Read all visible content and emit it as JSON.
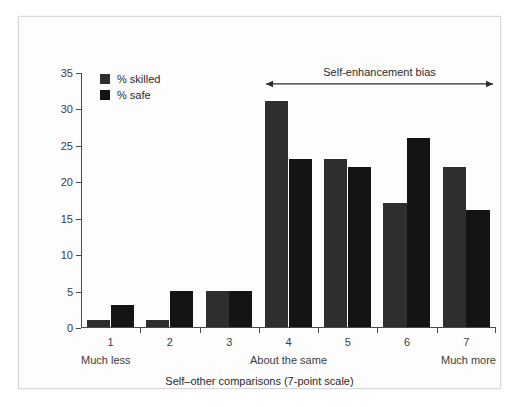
{
  "chart_data": {
    "type": "bar",
    "title": "",
    "subtitle": "",
    "xlabel": "Self–other comparisons (7-point scale)",
    "ylabel": "",
    "categories": [
      "1",
      "2",
      "3",
      "4",
      "5",
      "6",
      "7"
    ],
    "ylim": [
      0,
      35
    ],
    "yticks": [
      0,
      5,
      10,
      15,
      20,
      25,
      30,
      35
    ],
    "ytick_labels": [
      "0",
      "5",
      "10",
      "15",
      "20",
      "25",
      "30",
      "35"
    ],
    "grid": false,
    "legend_position": "upper-left",
    "series": [
      {
        "name": "% skilled",
        "color": "#2e2e2e",
        "values": [
          1,
          1,
          5,
          31,
          23,
          17,
          22
        ]
      },
      {
        "name": "% safe",
        "color": "#141414",
        "values": [
          3,
          5,
          5,
          23,
          22,
          26,
          16
        ]
      }
    ],
    "annotations": [
      {
        "text": "Self-enhancement bias",
        "type": "double-arrow",
        "from_category": "4",
        "to_category": "7",
        "y": 33.5
      }
    ],
    "axis_end_labels": {
      "left": "Much less",
      "center": "About the same",
      "right": "Much more"
    }
  },
  "figure": {
    "background_color": "#fdfdfd",
    "border_color": "#d8d8d8",
    "axis_color": "#4a4a4a",
    "text_color": "#3c3c3c"
  }
}
